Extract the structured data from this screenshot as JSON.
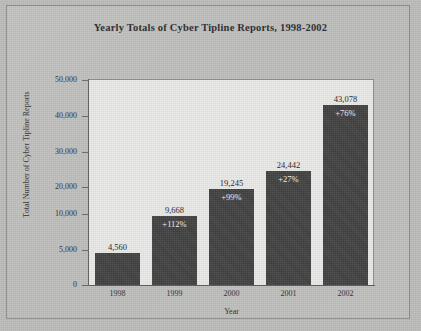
{
  "chart_data": {
    "type": "bar",
    "title": "Yearly Totals of Cyber Tipline Reports, 1998-2002",
    "xlabel": "Year",
    "ylabel": "Total Number of Cyber Tipline Reports",
    "categories": [
      "1998",
      "1999",
      "2000",
      "2001",
      "2002"
    ],
    "values": [
      4560,
      9668,
      19245,
      24442,
      43078
    ],
    "value_labels": [
      "4,560",
      "9,668",
      "19,245",
      "24,442",
      "43,078"
    ],
    "percent_change_labels": [
      "",
      "+112%",
      "+99%",
      "+27%",
      "+76%"
    ],
    "ylim": [
      0,
      50000
    ],
    "ytick_values": [
      0,
      5000,
      10000,
      20000,
      30000,
      40000,
      50000
    ],
    "ytick_labels": [
      "0",
      "5,000",
      "10,000",
      "20,000",
      "30,000",
      "40,000",
      "50,000"
    ],
    "grid": false,
    "legend": false,
    "bar_color": "#3f3f3f",
    "plot_background": "#e9e9e7",
    "page_background": "#bdbdbb"
  }
}
